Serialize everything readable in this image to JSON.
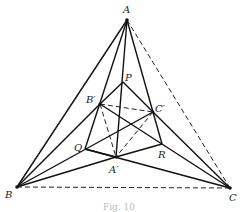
{
  "figure": {
    "caption": "Fig. 10",
    "points": {
      "A": {
        "label": "A",
        "x": 127,
        "y": 20,
        "lx": 123,
        "ly": 13
      },
      "B": {
        "label": "B",
        "x": 17,
        "y": 187,
        "lx": 5,
        "ly": 198
      },
      "C": {
        "label": "C",
        "x": 230,
        "y": 188,
        "lx": 229,
        "ly": 200
      },
      "P": {
        "label": "P",
        "x": 123,
        "y": 82,
        "lx": 125,
        "ly": 80
      },
      "B1": {
        "label": "B′",
        "x": 100,
        "y": 104,
        "lx": 87,
        "ly": 103
      },
      "C1": {
        "label": "C′",
        "x": 153,
        "y": 112,
        "lx": 155,
        "ly": 111
      },
      "Q": {
        "label": "Q",
        "x": 85,
        "y": 149,
        "lx": 74,
        "ly": 150
      },
      "R": {
        "label": "R",
        "x": 162,
        "y": 144,
        "lx": 158,
        "ly": 158
      },
      "A1": {
        "label": "A′",
        "x": 116,
        "y": 157,
        "lx": 108,
        "ly": 172
      }
    },
    "solid_segments": [
      [
        "A",
        "B"
      ],
      [
        "A",
        "C"
      ],
      [
        "A",
        "A1"
      ],
      [
        "A",
        "Q"
      ],
      [
        "A",
        "R"
      ],
      [
        "B",
        "C1"
      ],
      [
        "B",
        "A1"
      ],
      [
        "C",
        "B1"
      ],
      [
        "C",
        "A1"
      ],
      [
        "P",
        "B1"
      ],
      [
        "P",
        "C1"
      ],
      [
        "P",
        "A1"
      ],
      [
        "Q",
        "R"
      ],
      [
        "Q",
        "C1"
      ],
      [
        "R",
        "B1"
      ],
      [
        "B1",
        "Q"
      ],
      [
        "C1",
        "R"
      ],
      [
        "B",
        "Q"
      ],
      [
        "C",
        "R"
      ]
    ],
    "dashed_segments": [
      [
        "A",
        "B"
      ],
      [
        "A",
        "C"
      ],
      [
        "B",
        "C"
      ],
      [
        "B1",
        "C1"
      ],
      [
        "B1",
        "A1"
      ],
      [
        "C1",
        "A1"
      ]
    ]
  }
}
